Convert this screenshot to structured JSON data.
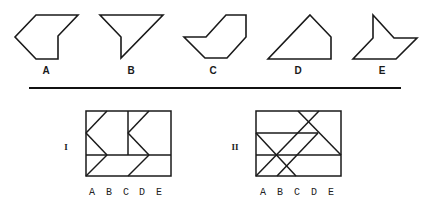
{
  "options": [
    {
      "label": "A",
      "points": "36,15 78,15 58,36 58,59 36,59 15,37",
      "label_x": 46,
      "label_y": 74
    },
    {
      "label": "B",
      "points": "100,15 163,15 121,58 121,37",
      "label_x": 131,
      "label_y": 74
    },
    {
      "label": "C",
      "points": "226,15 246,15 246,37 227,58 205,58 184,37 206,37",
      "label_x": 213,
      "label_y": 74
    },
    {
      "label": "D",
      "points": "310,15 331,37 331,59 268,59",
      "label_x": 298,
      "label_y": 74
    },
    {
      "label": "E",
      "points": "373,15 394,38 417,38 396,59 353,59 373,38",
      "label_x": 382,
      "label_y": 74
    }
  ],
  "divider": {
    "x1": 29,
    "y1": 88,
    "x2": 401,
    "y2": 88
  },
  "figures": [
    {
      "id": "I",
      "roman": "I",
      "roman_x": 66,
      "roman_y": 150,
      "rect": {
        "x": 86,
        "y": 111,
        "w": 85,
        "h": 65
      },
      "lines": [
        [
          128,
          111,
          128,
          155
        ],
        [
          86,
          155,
          171,
          155
        ],
        [
          107,
          111,
          86,
          133
        ],
        [
          86,
          133,
          107,
          155
        ],
        [
          107,
          155,
          86,
          176
        ],
        [
          149,
          111,
          128,
          133
        ],
        [
          128,
          133,
          149,
          155
        ],
        [
          149,
          155,
          128,
          176
        ]
      ],
      "col_labels": [
        "A",
        "B",
        "C",
        "D",
        "E"
      ],
      "col_x": [
        92,
        109,
        126,
        142,
        159
      ],
      "col_y": 195
    },
    {
      "id": "II",
      "roman": "II",
      "roman_x": 235,
      "roman_y": 150,
      "rect": {
        "x": 256,
        "y": 111,
        "w": 85,
        "h": 65
      },
      "lines": [
        [
          256,
          133,
          318,
          133
        ],
        [
          256,
          155,
          341,
          155
        ],
        [
          298,
          111,
          341,
          155
        ],
        [
          319,
          111,
          256,
          176
        ],
        [
          256,
          133,
          296,
          176
        ],
        [
          318,
          133,
          277,
          176
        ]
      ],
      "col_labels": [
        "A",
        "B",
        "C",
        "D",
        "E"
      ],
      "col_x": [
        263,
        280,
        297,
        314,
        331
      ],
      "col_y": 195
    }
  ]
}
